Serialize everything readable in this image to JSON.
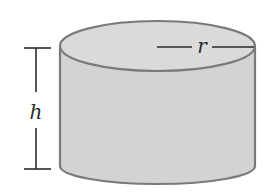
{
  "figure": {
    "shape": "cylinder",
    "labels": {
      "height": "h",
      "radius": "r"
    }
  },
  "colors": {
    "side_fill": "#d3d3d3",
    "top_fill": "#dadada",
    "outline": "#7a7a7a",
    "dimension_line": "#2a2a2a",
    "background": "#ffffff"
  }
}
